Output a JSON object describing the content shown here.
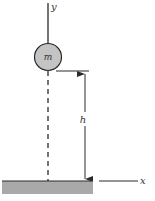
{
  "diagram": {
    "title": "",
    "labels": {
      "y_axis": "y",
      "x_axis": "x",
      "mass": "m",
      "height": "h"
    },
    "colors": {
      "line": "#2a2a2a",
      "mass_fill": "#c4c4c4",
      "ground_fill": "#a9a9a9",
      "background": "#ffffff"
    },
    "elements": [
      {
        "id": "y-axis",
        "type": "line",
        "style": "solid"
      },
      {
        "id": "mass",
        "type": "circle",
        "label": "m"
      },
      {
        "id": "reference-line",
        "type": "dashed-line"
      },
      {
        "id": "height-dimension",
        "type": "arrow",
        "label": "h"
      },
      {
        "id": "ground",
        "type": "rectangle"
      },
      {
        "id": "x-axis",
        "type": "line",
        "label": "x"
      }
    ]
  }
}
